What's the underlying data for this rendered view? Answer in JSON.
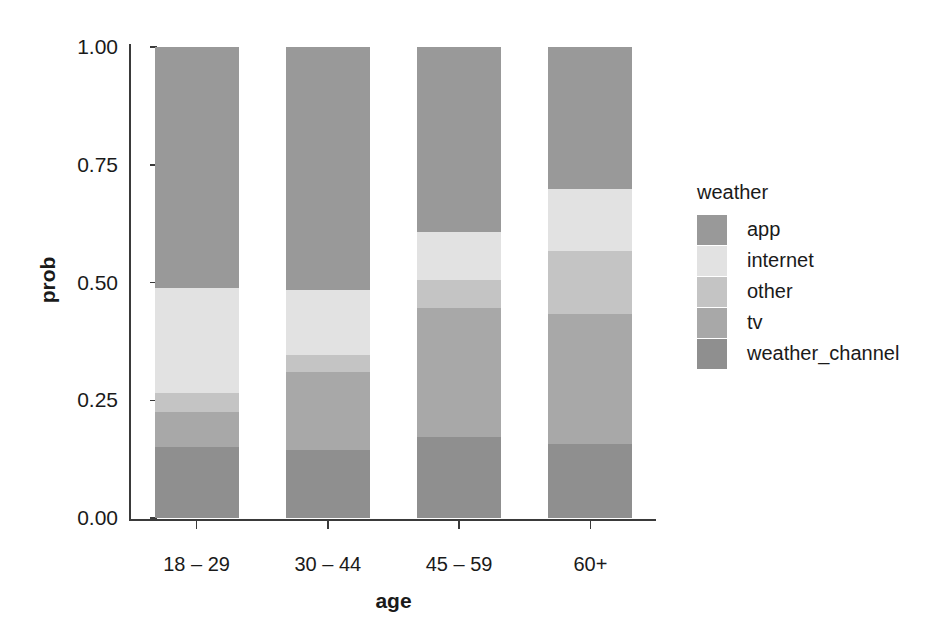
{
  "chart_data": {
    "type": "bar",
    "title": "",
    "subtitle": "",
    "stacked": true,
    "stack_normalized": true,
    "xlabel": "age",
    "ylabel": "prob",
    "categories": [
      "18 – 29",
      "30 – 44",
      "45 – 59",
      "60+"
    ],
    "ylim": [
      0.0,
      1.0
    ],
    "ytick_labels": [
      "0.00",
      "0.25",
      "0.50",
      "0.75",
      "1.00"
    ],
    "ytick_values": [
      0.0,
      0.25,
      0.5,
      0.75,
      1.0
    ],
    "grid": false,
    "legend_title": "weather",
    "legend_position": "right",
    "series": [
      {
        "name": "app",
        "color": "#999999",
        "values": [
          0.512,
          0.516,
          0.393,
          0.301
        ]
      },
      {
        "name": "internet",
        "color": "#e2e2e2",
        "values": [
          0.223,
          0.138,
          0.102,
          0.132
        ]
      },
      {
        "name": "other",
        "color": "#c4c4c4",
        "values": [
          0.04,
          0.036,
          0.059,
          0.134
        ]
      },
      {
        "name": "tv",
        "color": "#a8a8a8",
        "values": [
          0.074,
          0.166,
          0.274,
          0.276
        ]
      },
      {
        "name": "weather_channel",
        "color": "#8f8f8f",
        "values": [
          0.151,
          0.144,
          0.172,
          0.157
        ]
      }
    ]
  },
  "axes": {
    "y_title": "prob",
    "x_title": "age",
    "y_ticks": [
      {
        "label": "1.00",
        "value": 1.0
      },
      {
        "label": "0.75",
        "value": 0.75
      },
      {
        "label": "0.50",
        "value": 0.5
      },
      {
        "label": "0.25",
        "value": 0.25
      },
      {
        "label": "0.00",
        "value": 0.0
      }
    ],
    "x_ticks": [
      {
        "label": "18 – 29"
      },
      {
        "label": "30 – 44"
      },
      {
        "label": "45 – 59"
      },
      {
        "label": "60+"
      }
    ]
  },
  "legend": {
    "title": "weather",
    "items": [
      {
        "label": "app",
        "color": "#999999"
      },
      {
        "label": "internet",
        "color": "#e2e2e2"
      },
      {
        "label": "other",
        "color": "#c4c4c4"
      },
      {
        "label": "tv",
        "color": "#a8a8a8"
      },
      {
        "label": "weather_channel",
        "color": "#8f8f8f"
      }
    ]
  }
}
